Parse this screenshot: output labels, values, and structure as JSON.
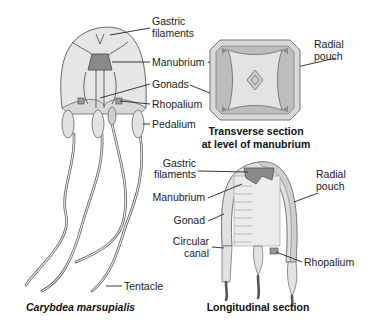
{
  "figure": {
    "species_caption": "Carybdea marsupialis",
    "whole_animal": {
      "labels": {
        "gastric_filaments_1": "Gastric",
        "gastric_filaments_2": "filaments",
        "manubrium": "Manubrium",
        "gonads": "Gonads",
        "rhopalium": "Rhopalium",
        "pedalium": "Pedalium",
        "tentacle": "Tentacle"
      }
    },
    "transverse_section": {
      "title_line1": "Transverse section",
      "title_line2": "at level of manubrium",
      "labels": {
        "radial_pouch_1": "Radial",
        "radial_pouch_2": "pouch"
      }
    },
    "longitudinal_section": {
      "title": "Longitudinal section",
      "labels": {
        "gastric_filaments_1": "Gastric",
        "gastric_filaments_2": "filaments",
        "manubrium": "Manubrium",
        "gonad": "Gonad",
        "circular_canal_1": "Circular",
        "circular_canal_2": "canal",
        "radial_pouch_1": "Radial",
        "radial_pouch_2": "pouch",
        "rhopalium": "Rhopalium"
      }
    }
  },
  "colors": {
    "body_fill": "#e4e4e4",
    "dark_tissue": "#8a8a8a",
    "pouch_fill": "#bdbdbd",
    "line": "#555555",
    "text": "#1a1a1a"
  }
}
